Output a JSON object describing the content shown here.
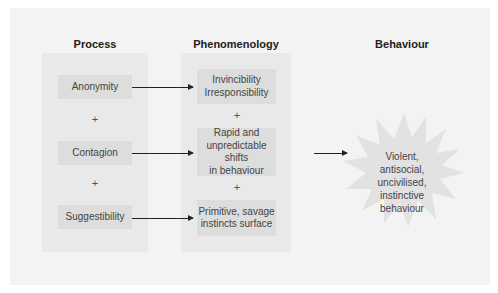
{
  "columns": {
    "process": "Process",
    "phenomenology": "Phenomenology",
    "behaviour": "Behaviour"
  },
  "process_items": [
    "Anonymity",
    "Contagion",
    "Suggestibility"
  ],
  "phenomenology_items": [
    "Invincibility\nIrresponsibility",
    "Rapid and\nunpredictable shifts\nin behaviour",
    "Primitive, savage\ninstincts surface"
  ],
  "plus_sign": "+",
  "behaviour_outcome": "Violent,\nantisocial,\nuncivilised,\ninstinctive\nbehaviour",
  "colors": {
    "panel": "#f3f3f3",
    "column_box": "#e9e9e9",
    "node": "#dddddd",
    "burst": "#e2e2e2",
    "arrow": "#222222"
  }
}
